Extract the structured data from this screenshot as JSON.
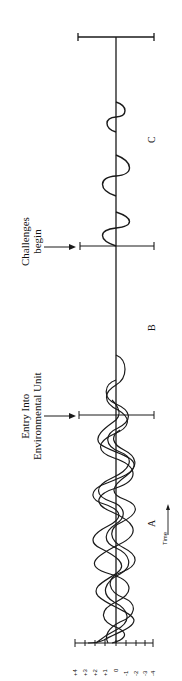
{
  "diagram": {
    "annotations": {
      "entry": {
        "line1": "Entry Into",
        "line2": "Environmental Unit"
      },
      "challenges": {
        "line1": "Challenges",
        "line2": "begin"
      }
    },
    "regions": [
      {
        "id": "A",
        "label": "A"
      },
      {
        "id": "B",
        "label": "B"
      },
      {
        "id": "C",
        "label": "C"
      }
    ],
    "time_axis": {
      "label": "Time"
    },
    "scale": {
      "ticks": [
        "+4",
        "+3",
        "+2",
        "+1",
        "0",
        "-1",
        "-2",
        "-3",
        "-4"
      ]
    },
    "colors": {
      "ink": "#1a1a1a",
      "background": "#ffffff"
    }
  }
}
